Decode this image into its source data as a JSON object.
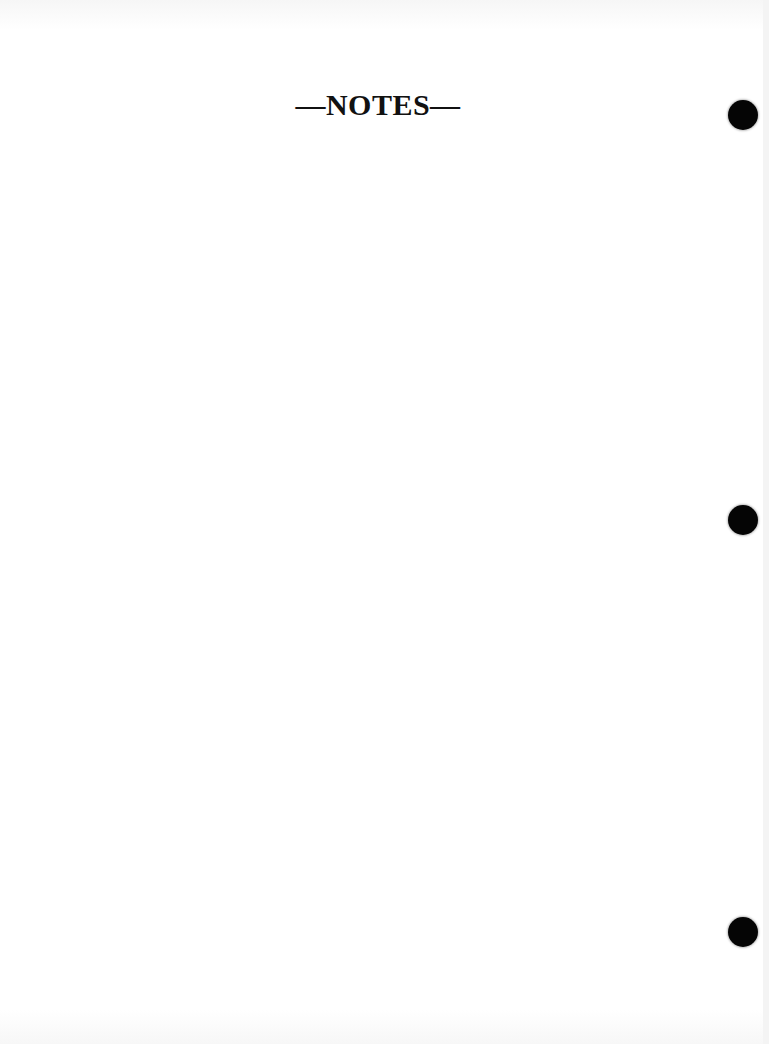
{
  "page": {
    "title": "—NOTES—",
    "background_color": "#ffffff",
    "text_color": "#111111"
  },
  "punch_holes": [
    {
      "position": "top",
      "color": "#050505"
    },
    {
      "position": "middle",
      "color": "#050505"
    },
    {
      "position": "bottom",
      "color": "#050505"
    }
  ]
}
